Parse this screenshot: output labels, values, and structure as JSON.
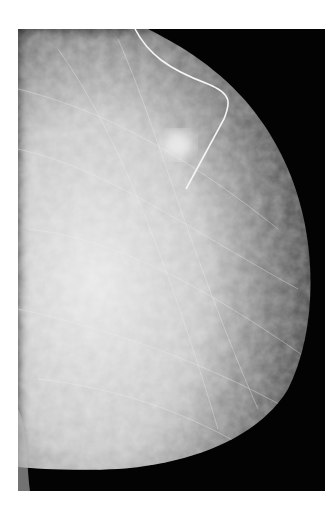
{
  "image": {
    "type": "mammogram",
    "view": "mediolateral",
    "features": [
      "breast-tissue",
      "localization-wire",
      "mass-lesion"
    ],
    "colors": {
      "background": "#ffffff",
      "film": "#030303",
      "tissue": "#d8d8d8",
      "wire": "#f5f5f5"
    }
  }
}
